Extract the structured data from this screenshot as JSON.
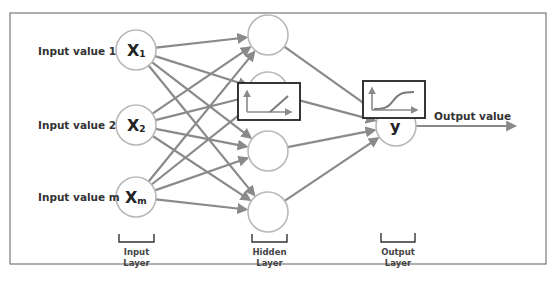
{
  "diagram": {
    "input_labels": [
      "Input value 1",
      "Input value 2",
      "Input value m"
    ],
    "input_nodes": [
      {
        "symbol": "X",
        "subscript": "1"
      },
      {
        "symbol": "X",
        "subscript": "2"
      },
      {
        "symbol": "X",
        "subscript": "m"
      }
    ],
    "hidden_node_count": 4,
    "output_node": {
      "symbol": "y"
    },
    "output_label": "Output value",
    "activation_functions": [
      {
        "layer": "hidden",
        "name": "rectifier-icon",
        "shape": "relu"
      },
      {
        "layer": "output",
        "name": "sigmoid-icon",
        "shape": "sigmoid"
      }
    ],
    "layer_labels": {
      "input": [
        "Input",
        "Layer"
      ],
      "hidden": [
        "Hidden",
        "Layer"
      ],
      "output": [
        "Output",
        "Layer"
      ]
    },
    "colors": {
      "edge": "#8a8a8a",
      "node_stroke": "#b9b9b9",
      "box_stroke": "#222222",
      "text": "#333333"
    }
  }
}
